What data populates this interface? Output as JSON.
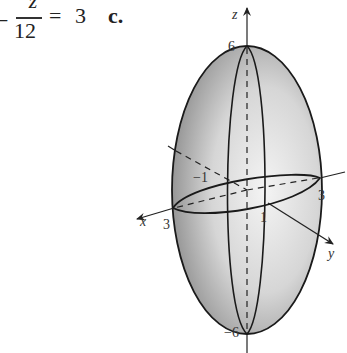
{
  "equation_fragment": {
    "leading_sign": "−",
    "numerator": "z",
    "denominator": "12",
    "equals": "=",
    "rhs": "3",
    "part_label": "c."
  },
  "figure": {
    "axes": {
      "x_label": "x",
      "y_label": "y",
      "z_label": "z"
    },
    "tick_labels": {
      "z_top": "6",
      "z_bottom": "−6",
      "x_pos": "3",
      "y_pos": "3",
      "y_neg": "−1",
      "x_small": "1"
    },
    "colors": {
      "surface_light": "#f2f2f2",
      "surface_dark": "#9a9a9a",
      "outline": "#1a1a1a"
    }
  }
}
